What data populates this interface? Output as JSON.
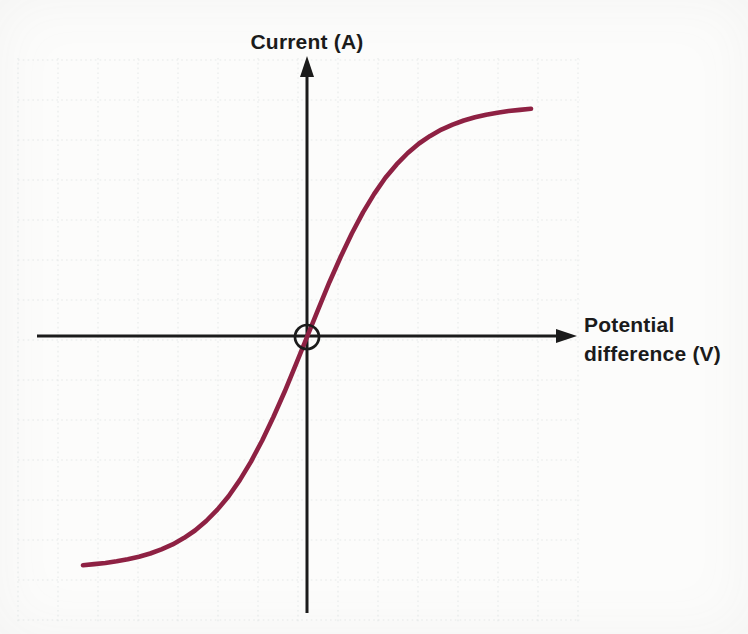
{
  "chart_data": {
    "type": "line",
    "title": "",
    "xlabel": "Potential difference (V)",
    "xlabel_lines": [
      "Potential",
      "difference (V)"
    ],
    "ylabel": "Current (A)",
    "x_range": [
      -1,
      1
    ],
    "y_range": [
      -1,
      1
    ],
    "grid": "faint dotted square grid, unlabeled axes (no tick values)",
    "axes_style": "axes cross at origin; arrowhead up on current axis, arrowhead right on potential-difference axis",
    "origin_marker": "open black circle drawn around the origin",
    "colors": {
      "curve": "#8e2143",
      "axis": "#1b1b1b",
      "grid": "#dfe4e4",
      "background": "#fcfcfb",
      "label_text": "#1b1b1b"
    },
    "series": [
      {
        "name": "current-vs-potential-difference (S-shaped filament-lamp characteristic)",
        "color": "#8e2143",
        "points": [
          [
            -1.0,
            -0.984
          ],
          [
            -0.95,
            -0.979
          ],
          [
            -0.9,
            -0.974
          ],
          [
            -0.85,
            -0.967
          ],
          [
            -0.8,
            -0.958
          ],
          [
            -0.75,
            -0.947
          ],
          [
            -0.7,
            -0.933
          ],
          [
            -0.65,
            -0.915
          ],
          [
            -0.6,
            -0.894
          ],
          [
            -0.55,
            -0.867
          ],
          [
            -0.5,
            -0.834
          ],
          [
            -0.45,
            -0.793
          ],
          [
            -0.4,
            -0.744
          ],
          [
            -0.35,
            -0.686
          ],
          [
            -0.3,
            -0.617
          ],
          [
            -0.25,
            -0.537
          ],
          [
            -0.2,
            -0.446
          ],
          [
            -0.15,
            -0.345
          ],
          [
            -0.1,
            -0.236
          ],
          [
            -0.05,
            -0.119
          ],
          [
            0.0,
            0.0
          ],
          [
            0.05,
            0.119
          ],
          [
            0.1,
            0.236
          ],
          [
            0.15,
            0.345
          ],
          [
            0.2,
            0.446
          ],
          [
            0.25,
            0.537
          ],
          [
            0.3,
            0.617
          ],
          [
            0.35,
            0.686
          ],
          [
            0.4,
            0.744
          ],
          [
            0.45,
            0.793
          ],
          [
            0.5,
            0.834
          ],
          [
            0.55,
            0.867
          ],
          [
            0.6,
            0.894
          ],
          [
            0.65,
            0.915
          ],
          [
            0.7,
            0.933
          ],
          [
            0.75,
            0.947
          ],
          [
            0.8,
            0.958
          ],
          [
            0.85,
            0.967
          ],
          [
            0.9,
            0.974
          ],
          [
            0.95,
            0.979
          ],
          [
            1.0,
            0.984
          ]
        ]
      }
    ]
  }
}
